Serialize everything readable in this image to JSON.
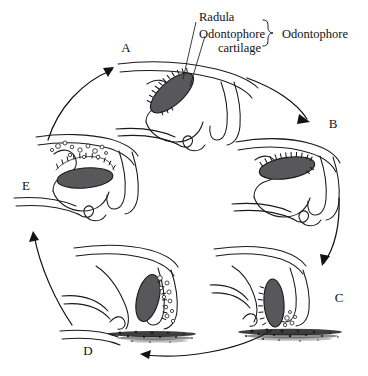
{
  "figure": {
    "background_color": "#ffffff",
    "ink_color": "#1a1a1a",
    "cartilage_color": "#58585a"
  },
  "callouts": {
    "radula": "Radula",
    "cartilage_line1": "Odontophore",
    "cartilage_line2": "cartilage",
    "bracket_group": "Odontophore"
  },
  "stages": [
    {
      "letter": "A",
      "name": "stage-a",
      "description": "Odontophore protracted, radula tilted forward within buccal mass"
    },
    {
      "letter": "B",
      "name": "stage-b",
      "description": "Odontophore rotating, radula nearly horizontal"
    },
    {
      "letter": "C",
      "name": "stage-c",
      "description": "Radula applied to substrate, scraping food particles"
    },
    {
      "letter": "D",
      "name": "stage-d",
      "description": "Radula retracting with food particles carried along teeth"
    },
    {
      "letter": "E",
      "name": "stage-e",
      "description": "Food particles released into buccal cavity, radula withdrawn"
    }
  ],
  "cycle_arrows": [
    {
      "name": "arrow-e-to-a",
      "from": "E",
      "to": "A"
    },
    {
      "name": "arrow-a-to-b",
      "from": "A",
      "to": "B"
    },
    {
      "name": "arrow-b-to-c",
      "from": "B",
      "to": "C"
    },
    {
      "name": "arrow-c-to-d",
      "from": "C",
      "to": "D"
    },
    {
      "name": "arrow-d-to-e",
      "from": "D",
      "to": "E"
    }
  ]
}
